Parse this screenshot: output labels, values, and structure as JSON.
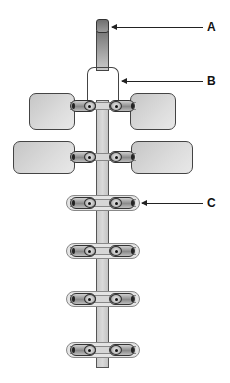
{
  "diagram": {
    "labels": [
      {
        "id": "A",
        "text": "A",
        "x": 207,
        "y": 22,
        "arrow_from_x": 112,
        "arrow_to_x": 203,
        "arrow_y": 27
      },
      {
        "id": "B",
        "text": "B",
        "x": 207,
        "y": 76,
        "arrow_from_x": 122,
        "arrow_to_x": 203,
        "arrow_y": 81
      },
      {
        "id": "C",
        "text": "C",
        "x": 207,
        "y": 198,
        "arrow_from_x": 142,
        "arrow_to_x": 203,
        "arrow_y": 203
      }
    ],
    "colors": {
      "line": "#222222",
      "pad": "#d4d4d4",
      "strap": "#cccccc"
    },
    "pads": [
      {
        "side": "left",
        "x": 29,
        "y": 93,
        "w": 46,
        "h": 37
      },
      {
        "side": "right",
        "x": 130,
        "y": 93,
        "w": 46,
        "h": 37
      },
      {
        "side": "left",
        "x": 13,
        "y": 141,
        "w": 62,
        "h": 33
      },
      {
        "side": "right",
        "x": 131,
        "y": 141,
        "w": 62,
        "h": 33
      }
    ],
    "clip_rows_y": [
      106,
      157,
      203,
      251,
      299,
      350
    ]
  }
}
